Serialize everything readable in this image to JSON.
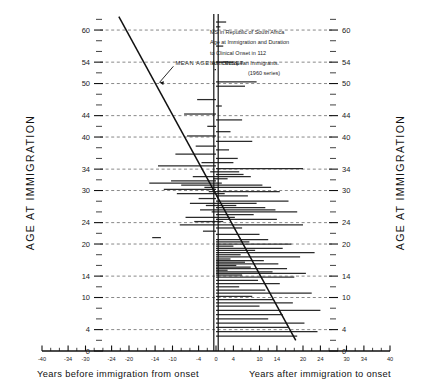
{
  "chart_data": {
    "type": "bar",
    "title_lines": [
      "MS in Republic of South Africa",
      "Age at Immigration and Duration",
      "to Clinical Onset in 112",
      "North European Immigrants.",
      "(1960 series)"
    ],
    "ylabel_left": "AGE AT IMMIGRATION",
    "ylabel_right": "AGE AT IMMIGRATION",
    "xlabel_left": "Years before immigration from onset",
    "xlabel_right": "Years after immigration to onset",
    "xlim": [
      -40,
      40
    ],
    "ylim": [
      0,
      63
    ],
    "xticks": [
      -40,
      -34,
      -30,
      -24,
      -20,
      -14,
      -10,
      -4,
      0,
      4,
      10,
      14,
      20,
      24,
      30,
      34,
      40
    ],
    "xticklabels": [
      "-40",
      "-34",
      "-30",
      "-24",
      "-20",
      "-14",
      "-10",
      "-4",
      "0",
      "4",
      "10",
      "14",
      "20",
      "24",
      "30",
      "34",
      "40"
    ],
    "xminorticks": [
      -38,
      -36,
      -32,
      -28,
      -26,
      -22,
      -18,
      -16,
      -12,
      -8,
      -6,
      -2,
      2,
      6,
      8,
      12,
      16,
      18,
      22,
      26,
      28,
      32,
      36,
      38
    ],
    "yticks": [
      0,
      4,
      10,
      14,
      20,
      24,
      30,
      34,
      40,
      44,
      50,
      54,
      60
    ],
    "yticklabels": [
      "0",
      "4",
      "10",
      "14",
      "20",
      "24",
      "30",
      "34",
      "40",
      "44",
      "50",
      "54",
      "60"
    ],
    "yminorticks": [
      2,
      6,
      8,
      12,
      16,
      18,
      22,
      26,
      28,
      32,
      36,
      38,
      42,
      46,
      48,
      52,
      56,
      58,
      62
    ],
    "gridlines_y": [
      4,
      10,
      14,
      20,
      24,
      30,
      34,
      40,
      44,
      50,
      54,
      60
    ],
    "grid": "dashed-horizontal",
    "zero_axis": 0,
    "annotation": {
      "text": "MEAN AGE AT ONSET",
      "x": -14,
      "y": 53.5,
      "leader_to_x": -19.5,
      "leader_to_y": 50.2
    },
    "regression_line": {
      "name": "mean age at onset regression",
      "x0": -33.5,
      "y0": 62.5,
      "x1": 27.5,
      "y1": 2.0
    },
    "xlabel": "Years relative to immigration",
    "ylabel": "Age at immigration",
    "legend_position": "none",
    "series": [
      {
        "name": "duration from immigration to onset",
        "description": "Each horizontal line is one patient: spans from age at immigration (x=0 anchor) to years before/after immigration of clinical onset.",
        "bars": [
          {
            "age": 61.5,
            "x0": 0,
            "x1": 3.5
          },
          {
            "age": 60.6,
            "x0": 0,
            "x1": 1.5
          },
          {
            "age": 57.0,
            "x0": 0,
            "x1": 2.5
          },
          {
            "age": 54.0,
            "x0": 0,
            "x1": 6.0
          },
          {
            "age": 52.6,
            "x0": -0.5,
            "x1": 0
          },
          {
            "age": 50.3,
            "x0": 0,
            "x1": 14.0
          },
          {
            "age": 49.5,
            "x0": 0,
            "x1": 10.0
          },
          {
            "age": 47.0,
            "x0": -6.5,
            "x1": 0
          },
          {
            "age": 45.8,
            "x0": 0,
            "x1": 2.0
          },
          {
            "age": 44.3,
            "x0": -11.0,
            "x1": 0
          },
          {
            "age": 43.2,
            "x0": 0,
            "x1": 9.0
          },
          {
            "age": 42.0,
            "x0": -3.0,
            "x1": 0
          },
          {
            "age": 41.0,
            "x0": 0,
            "x1": 5.0
          },
          {
            "age": 40.2,
            "x0": -10.0,
            "x1": 0
          },
          {
            "age": 39.2,
            "x0": 0,
            "x1": 12.5
          },
          {
            "age": 38.3,
            "x0": -7.0,
            "x1": 0
          },
          {
            "age": 37.6,
            "x0": 0,
            "x1": 4.5
          },
          {
            "age": 36.8,
            "x0": -14.0,
            "x1": 0
          },
          {
            "age": 36.0,
            "x0": 0,
            "x1": 7.5
          },
          {
            "age": 35.2,
            "x0": -5.0,
            "x1": 6.0
          },
          {
            "age": 34.6,
            "x0": -20.0,
            "x1": 0
          },
          {
            "age": 34.1,
            "x0": 0,
            "x1": 30.0
          },
          {
            "age": 33.5,
            "x0": -2.0,
            "x1": 8.0
          },
          {
            "age": 33.0,
            "x0": 0,
            "x1": 9.5
          },
          {
            "age": 32.6,
            "x0": -8.0,
            "x1": 12.0
          },
          {
            "age": 32.2,
            "x0": -1.0,
            "x1": 4.0
          },
          {
            "age": 31.8,
            "x0": -15.5,
            "x1": 0
          },
          {
            "age": 31.4,
            "x0": -23.0,
            "x1": 2.0
          },
          {
            "age": 31.0,
            "x0": -12.0,
            "x1": 16.0
          },
          {
            "age": 30.6,
            "x0": -4.0,
            "x1": 19.0
          },
          {
            "age": 30.2,
            "x0": -18.0,
            "x1": 0
          },
          {
            "age": 29.8,
            "x0": -2.5,
            "x1": 22.0
          },
          {
            "age": 29.4,
            "x0": -13.5,
            "x1": 3.0
          },
          {
            "age": 29.0,
            "x0": 0,
            "x1": 11.0
          },
          {
            "age": 28.5,
            "x0": -6.0,
            "x1": 0
          },
          {
            "age": 28.0,
            "x0": 0,
            "x1": 25.0
          },
          {
            "age": 27.6,
            "x0": -9.0,
            "x1": 14.0
          },
          {
            "age": 27.2,
            "x0": -3.5,
            "x1": 7.0
          },
          {
            "age": 26.8,
            "x0": 0,
            "x1": 17.0
          },
          {
            "age": 26.4,
            "x0": -5.5,
            "x1": 20.5
          },
          {
            "age": 26.0,
            "x0": -1.5,
            "x1": 28.0
          },
          {
            "age": 25.5,
            "x0": 0,
            "x1": 13.0
          },
          {
            "age": 25.0,
            "x0": -10.5,
            "x1": 6.5
          },
          {
            "age": 24.6,
            "x0": 0,
            "x1": 21.0
          },
          {
            "age": 24.2,
            "x0": -7.5,
            "x1": 2.5
          },
          {
            "age": 23.6,
            "x0": -12.5,
            "x1": 30.0
          },
          {
            "age": 23.0,
            "x0": 0,
            "x1": 9.0
          },
          {
            "age": 22.4,
            "x0": -4.5,
            "x1": 0
          },
          {
            "age": 21.8,
            "x0": 0,
            "x1": 15.0
          },
          {
            "age": 21.2,
            "x0": -22.0,
            "x1": -19.0
          },
          {
            "age": 20.8,
            "x0": 0,
            "x1": 18.0
          },
          {
            "age": 20.4,
            "x0": 0,
            "x1": 11.5
          },
          {
            "age": 20.0,
            "x0": 0,
            "x1": 26.0
          },
          {
            "age": 19.6,
            "x0": 0,
            "x1": 6.0
          },
          {
            "age": 19.2,
            "x0": 0,
            "x1": 23.0
          },
          {
            "age": 18.8,
            "x0": 0,
            "x1": 13.5
          },
          {
            "age": 18.4,
            "x0": 0,
            "x1": 34.0
          },
          {
            "age": 18.0,
            "x0": 0,
            "x1": 8.5
          },
          {
            "age": 17.6,
            "x0": 0,
            "x1": 29.0
          },
          {
            "age": 17.2,
            "x0": 0,
            "x1": 5.0
          },
          {
            "age": 16.9,
            "x0": 0,
            "x1": 16.5
          },
          {
            "age": 16.6,
            "x0": 0,
            "x1": 10.0
          },
          {
            "age": 16.3,
            "x0": 0,
            "x1": 21.5
          },
          {
            "age": 16.0,
            "x0": 0,
            "x1": 7.0
          },
          {
            "age": 15.7,
            "x0": 0,
            "x1": 12.0
          },
          {
            "age": 15.4,
            "x0": 0,
            "x1": 24.5
          },
          {
            "age": 15.1,
            "x0": 0,
            "x1": 4.0
          },
          {
            "age": 14.8,
            "x0": 0,
            "x1": 19.5
          },
          {
            "age": 14.5,
            "x0": 0,
            "x1": 31.0
          },
          {
            "age": 14.2,
            "x0": 0,
            "x1": 9.0
          },
          {
            "age": 13.8,
            "x0": 0,
            "x1": 27.0
          },
          {
            "age": 13.2,
            "x0": 0,
            "x1": 14.5
          },
          {
            "age": 12.6,
            "x0": 0,
            "x1": 22.0
          },
          {
            "age": 12.0,
            "x0": 0,
            "x1": 8.0
          },
          {
            "age": 11.4,
            "x0": 0,
            "x1": 17.0
          },
          {
            "age": 10.8,
            "x0": 0,
            "x1": 33.0
          },
          {
            "age": 10.2,
            "x0": 0,
            "x1": 12.5
          },
          {
            "age": 9.6,
            "x0": 0,
            "x1": 20.0
          },
          {
            "age": 9.0,
            "x0": 0,
            "x1": 26.5
          },
          {
            "age": 8.4,
            "x0": 0,
            "x1": 15.0
          },
          {
            "age": 7.6,
            "x0": 0,
            "x1": 36.0
          },
          {
            "age": 6.8,
            "x0": 0,
            "x1": 23.0
          },
          {
            "age": 6.0,
            "x0": 0,
            "x1": 18.0
          },
          {
            "age": 5.2,
            "x0": 0,
            "x1": 30.5
          },
          {
            "age": 4.4,
            "x0": 0,
            "x1": 25.0
          },
          {
            "age": 3.6,
            "x0": 0,
            "x1": 35.0
          },
          {
            "age": 2.8,
            "x0": 0,
            "x1": 28.0
          }
        ]
      }
    ]
  }
}
